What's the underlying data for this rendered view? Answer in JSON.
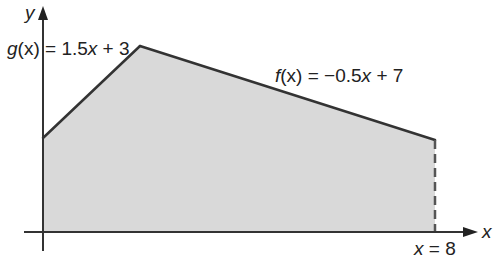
{
  "diagram": {
    "title": "",
    "axes": {
      "x_label": "x",
      "y_label": "y"
    },
    "functions": [
      {
        "name": "g",
        "label_fn": "g",
        "label_arg": "(x)",
        "label_rest": " = 1.5",
        "label_var": "x",
        "label_tail": " + 3",
        "expression": "g(x) = 1.5x + 3",
        "slope": 1.5,
        "intercept": 3
      },
      {
        "name": "f",
        "label_fn": "f",
        "label_arg": "(x)",
        "label_rest": " = −0.5",
        "label_var": "x",
        "label_tail": " + 7",
        "expression": "f(x) = -0.5x + 7",
        "slope": -0.5,
        "intercept": 7
      }
    ],
    "boundary": {
      "label_var": "x",
      "label_rest": " = 8",
      "expression": "x = 8",
      "value": 8
    },
    "region": {
      "description": "Shaded area under g(x) and f(x) from x = 0 to x = 8",
      "vertices_math": [
        [
          0,
          0
        ],
        [
          0,
          3
        ],
        [
          2,
          6
        ],
        [
          8,
          3
        ],
        [
          8,
          0
        ]
      ]
    },
    "colors": {
      "fill": "#d9d9d9",
      "line": "#333333",
      "axis": "#333333",
      "text": "#222222"
    }
  }
}
